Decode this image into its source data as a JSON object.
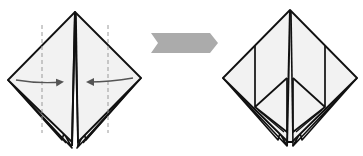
{
  "diagram": {
    "title": "Origami fold step",
    "steps": [
      {
        "id": "before",
        "label": "Fold left and right edges to the center line",
        "shape": "preliminary base (diamond)",
        "fold_lines": "dashed valley lines",
        "arrows": [
          "left flap folds to center",
          "right flap folds to center"
        ]
      },
      {
        "id": "after",
        "label": "Result: edges folded to center",
        "shape": "diamond with kite folds"
      }
    ],
    "transition": "step arrow"
  },
  "colors": {
    "paper_fill": "#f2f2f2",
    "outline": "#111111",
    "dashed_line": "#9a9a9a",
    "fold_arrow": "#555555",
    "step_arrow": "#ababab",
    "background": "#ffffff"
  }
}
